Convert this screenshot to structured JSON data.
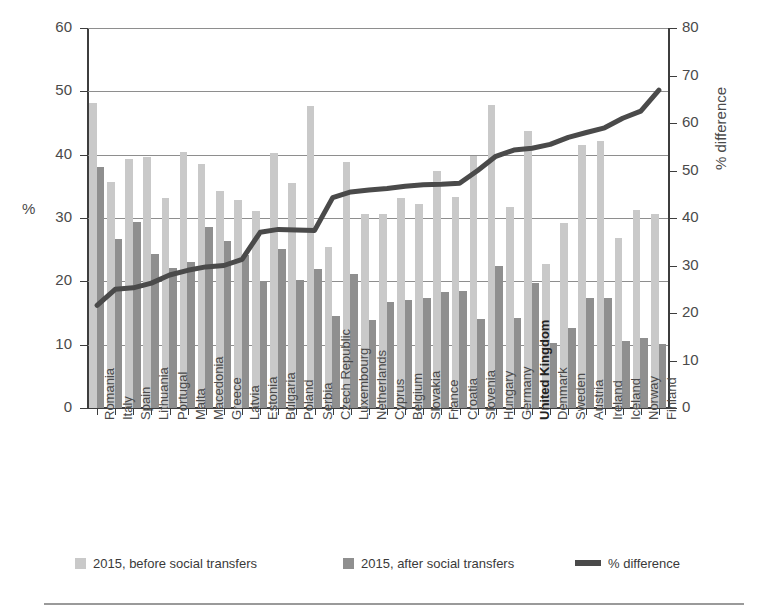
{
  "chart_data": {
    "type": "bar",
    "title": "",
    "xlabel": "",
    "ylabel": "%",
    "ylabel_secondary": "% difference",
    "ylim": [
      0,
      60
    ],
    "ylim_secondary": [
      0,
      80
    ],
    "yticks": [
      0,
      10,
      20,
      30,
      40,
      50,
      60
    ],
    "yticks_secondary": [
      0,
      10,
      20,
      30,
      40,
      50,
      60,
      70,
      80
    ],
    "grid": true,
    "legend_position": "bottom",
    "categories": [
      "Romania",
      "Italy",
      "Spain",
      "Lithuania",
      "Portugal",
      "Malta",
      "Macedonia",
      "Greece",
      "Latvia",
      "Estonia",
      "Bulgaria",
      "Poland",
      "Serbia",
      "Czech Republic",
      "Luxembourg",
      "Netherlands",
      "Cyprus",
      "Belgium",
      "Slovakia",
      "France",
      "Croatia",
      "Slovenia",
      "Hungary",
      "Germany",
      "United Kingdom",
      "Denmark",
      "Sweden",
      "Austria",
      "Ireland",
      "Iceland",
      "Norway",
      "Finland"
    ],
    "bold_categories": [
      "United Kingdom"
    ],
    "series": [
      {
        "name": "2015, before social transfers",
        "axis": "left",
        "color": "#c9c9c9",
        "values": [
          48.2,
          35.7,
          39.3,
          39.7,
          33.2,
          40.5,
          38.6,
          34.2,
          32.8,
          31.1,
          40.3,
          35.5,
          47.7,
          25.5,
          38.8,
          30.7,
          30.6,
          33.1,
          32.2,
          37.4,
          33.3,
          39.8,
          47.8,
          31.8,
          43.7,
          22.8,
          29.2,
          41.6,
          42.2,
          26.8,
          31.3,
          30.6
        ]
      },
      {
        "name": "2015, after social transfers",
        "axis": "left",
        "color": "#8f8f8f",
        "values": [
          38.0,
          26.7,
          29.4,
          24.3,
          22.1,
          23.0,
          28.6,
          26.4,
          24.2,
          20.0,
          25.1,
          20.2,
          22.0,
          14.6,
          21.2,
          13.9,
          16.7,
          17.1,
          17.3,
          18.3,
          18.5,
          14.1,
          22.5,
          14.2,
          19.7,
          10.2,
          12.6,
          17.3,
          17.4,
          10.6,
          11.0,
          10.1
        ]
      },
      {
        "name": "% difference",
        "axis": "right",
        "color": "#4a4a4a",
        "values": [
          21.6,
          25.0,
          25.3,
          26.3,
          28.0,
          29.0,
          29.7,
          30.0,
          31.3,
          37.0,
          37.6,
          37.5,
          37.4,
          44.3,
          45.5,
          45.9,
          46.2,
          46.7,
          47.0,
          47.1,
          47.3,
          50.0,
          53.0,
          54.3,
          54.7,
          55.5,
          57.0,
          58.0,
          59.0,
          61.0,
          62.5,
          66.9
        ]
      }
    ]
  },
  "legend": {
    "items": [
      {
        "label": "2015, before social transfers",
        "marker": "square-light"
      },
      {
        "label": "2015, after social transfers",
        "marker": "square-dark"
      },
      {
        "label": "% difference",
        "marker": "line-dark"
      }
    ]
  },
  "axes": {
    "left_title": "%",
    "right_title": "% difference"
  }
}
